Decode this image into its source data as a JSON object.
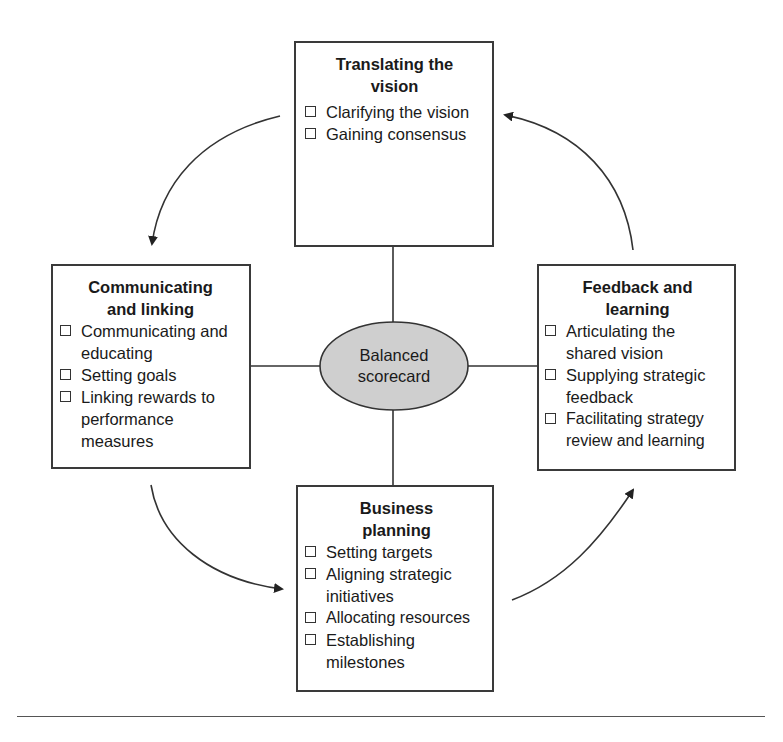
{
  "diagram": {
    "hub": {
      "label_line1": "Balanced",
      "label_line2": "scorecard",
      "fill": "#cfcfcf",
      "stroke": "#333333"
    },
    "boxes": {
      "top": {
        "title": "Translating the vision",
        "items": [
          "Clarifying the vision",
          "Gaining consensus"
        ]
      },
      "left": {
        "title": "Communicating and linking",
        "items": [
          "Communicating and educating",
          "Setting goals",
          "Linking rewards to performance measures"
        ]
      },
      "right": {
        "title": "Feedback and learning",
        "items": [
          "Articulating the shared vision",
          "Supplying strategic feedback",
          "Facilitating strategy review and learning"
        ]
      },
      "bottom": {
        "title": "Business planning",
        "items": [
          "Setting targets",
          "Aligning strategic initiatives",
          "Allocating resources",
          "Establishing milestones"
        ]
      }
    },
    "flow": [
      "Translating the vision",
      "Communicating and linking",
      "Business planning",
      "Feedback and learning",
      "Translating the vision"
    ],
    "colors": {
      "line": "#333333",
      "box_border": "#3a3a3a",
      "text": "#1a1a1a"
    }
  }
}
